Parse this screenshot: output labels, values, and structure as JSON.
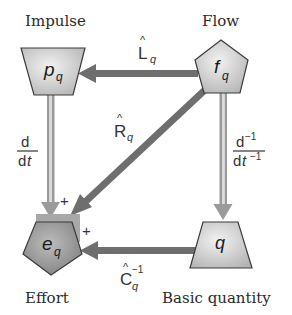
{
  "nodes": {
    "impulse": {
      "caption": "Impulse",
      "symbol": "p",
      "subscript": "q",
      "shape": "inverted-trapezoid"
    },
    "flow": {
      "caption": "Flow",
      "symbol": "f",
      "subscript": "q",
      "shape": "pentagon"
    },
    "effort": {
      "caption": "Effort",
      "symbol": "e",
      "subscript": "q",
      "shape": "pentagon-inverted"
    },
    "basic": {
      "caption": "Basic quantity",
      "symbol": "q",
      "subscript": "",
      "shape": "trapezoid"
    }
  },
  "edges": {
    "L": {
      "operator": "L",
      "hat": "^",
      "subscript": "q",
      "from": "flow",
      "to": "impulse"
    },
    "R": {
      "operator": "R",
      "hat": "^",
      "subscript": "q",
      "from": "flow",
      "to": "effort"
    },
    "C": {
      "operator": "C",
      "hat": "^",
      "subscript": "q",
      "superscript": "−1",
      "from": "basic",
      "to": "effort"
    },
    "ddt": {
      "numerator": "d",
      "denominator_d": "d",
      "denominator_t": "t",
      "from": "impulse",
      "to": "effort"
    },
    "ddt_inv": {
      "numerator": "d",
      "numerator_exp": "−1",
      "denominator_d": "d",
      "denominator_t": "t",
      "denominator_exp": "−1",
      "from": "flow",
      "to": "basic"
    }
  },
  "signs": {
    "top": "+",
    "right": "+"
  },
  "colors": {
    "arrow_dark": "#6e6e6e",
    "arrow_light": "#9a9a9a",
    "node_fill_light": "#e6e6e6",
    "node_fill_dark": "#b0b0b0",
    "effort_fill": "#9c9c9c",
    "stroke": "#3a3a3a"
  }
}
